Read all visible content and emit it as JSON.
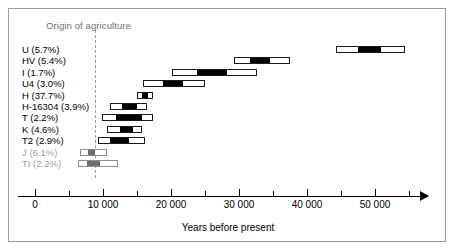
{
  "chart_data": {
    "type": "bar",
    "subtype": "range-bar-with-confidence-interval",
    "title": "",
    "xlabel": "Years before present",
    "ylabel": "",
    "xlim": [
      0,
      57000
    ],
    "grid": false,
    "legend": false,
    "annotations": [
      {
        "name": "origin-of-agriculture",
        "label": "Origin of agriculture",
        "x": 8800,
        "style": "dashed-vertical-line"
      }
    ],
    "axis": {
      "major_ticks": [
        0,
        10000,
        20000,
        30000,
        40000,
        50000
      ],
      "major_tick_labels": [
        "0",
        "10 000",
        "20 000",
        "30 000",
        "40 000",
        "50 000"
      ],
      "minor_ticks": [
        5000,
        15000,
        25000,
        35000,
        45000,
        55000
      ]
    },
    "categories": [
      "U (5.7%)",
      "HV (5.4%)",
      "I (1.7%)",
      "U4 (3.0%)",
      "H (37.7%)",
      "H-16304 (3.9%)",
      "T (2.2%)",
      "K (4.6%)",
      "T2 (2.9%)",
      "J (6.1%)",
      "TI (2.2%)"
    ],
    "rows": [
      {
        "label": "U (5.7%)",
        "haplogroup": "U",
        "frequency_pct": 5.7,
        "range_low": 44300,
        "range_high": 54400,
        "core_low": 47500,
        "core_high": 50900,
        "muted": false
      },
      {
        "label": "HV (5.4%)",
        "haplogroup": "HV",
        "frequency_pct": 5.4,
        "range_low": 29300,
        "range_high": 37500,
        "core_low": 31600,
        "core_high": 34600,
        "muted": false
      },
      {
        "label": "I (1.7%)",
        "haplogroup": "I",
        "frequency_pct": 1.7,
        "range_low": 20100,
        "range_high": 32600,
        "core_low": 23800,
        "core_high": 28200,
        "muted": false
      },
      {
        "label": "U4 (3.0%)",
        "haplogroup": "U4",
        "frequency_pct": 3.0,
        "range_low": 15900,
        "range_high": 25000,
        "core_low": 18800,
        "core_high": 21800,
        "muted": false
      },
      {
        "label": "H (37.7%)",
        "haplogroup": "H",
        "frequency_pct": 37.7,
        "range_low": 15000,
        "range_high": 17400,
        "core_low": 15700,
        "core_high": 16600,
        "muted": false
      },
      {
        "label": "H-16304 (3.9%)",
        "haplogroup": "H-16304",
        "frequency_pct": 3.9,
        "range_low": 11000,
        "range_high": 16500,
        "core_low": 12800,
        "core_high": 15000,
        "muted": false
      },
      {
        "label": "T (2.2%)",
        "haplogroup": "T",
        "frequency_pct": 2.2,
        "range_low": 9900,
        "range_high": 17400,
        "core_low": 11900,
        "core_high": 15700,
        "muted": false
      },
      {
        "label": "K (4.6%)",
        "haplogroup": "K",
        "frequency_pct": 4.6,
        "range_low": 10600,
        "range_high": 15700,
        "core_low": 12500,
        "core_high": 14400,
        "muted": false
      },
      {
        "label": "T2 (2.9%)",
        "haplogroup": "T2",
        "frequency_pct": 2.9,
        "range_low": 9300,
        "range_high": 16200,
        "core_low": 11000,
        "core_high": 13800,
        "muted": false
      },
      {
        "label": "J (6.1%)",
        "haplogroup": "J",
        "frequency_pct": 6.1,
        "range_low": 6600,
        "range_high": 10600,
        "core_low": 7800,
        "core_high": 8800,
        "muted": true
      },
      {
        "label": "TI (2.2%)",
        "haplogroup": "TI",
        "frequency_pct": 2.2,
        "range_low": 6300,
        "range_high": 12200,
        "core_low": 7600,
        "core_high": 9600,
        "muted": true
      }
    ],
    "colors": {
      "bar_outline": "#1a1a1a",
      "bar_fill": "#ffffff",
      "bar_core": "#000000",
      "bar_outline_muted": "#8e8e8e",
      "bar_core_muted": "#6e6e6e",
      "annotation": "#6f6f6f",
      "muted_label": "#9d9d9d",
      "axis": "#000000",
      "frame": "#9a9a9a"
    }
  }
}
